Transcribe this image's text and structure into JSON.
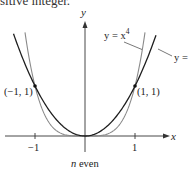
{
  "header": {
    "cropped_text": "sitive integer."
  },
  "chart_data": {
    "type": "line",
    "title": "",
    "caption": "n even",
    "xlabel": "x",
    "ylabel": "y",
    "x_ticks": [
      -1,
      1
    ],
    "x_tick_labels": [
      "−1",
      "1"
    ],
    "xlim": [
      -1.7,
      1.67
    ],
    "ylim": [
      -0.3,
      2.3
    ],
    "grid": false,
    "series": [
      {
        "name": "y = x^2",
        "label": "y =",
        "color": "#222222",
        "function": "x^2",
        "x": [
          -1.43,
          -1,
          0,
          1,
          1.42
        ],
        "values": [
          2.04,
          1,
          0,
          1,
          2.02
        ]
      },
      {
        "name": "y = x^4",
        "label": "y = x⁴",
        "color": "#888888",
        "function": "x^4",
        "x": [
          -1.2,
          -1,
          0,
          1,
          1.2
        ],
        "values": [
          2.07,
          1,
          0,
          1,
          2.07
        ]
      }
    ],
    "points": [
      {
        "label": "(−1, 1)",
        "x": -1,
        "y": 1
      },
      {
        "label": "(1, 1)",
        "x": 1,
        "y": 1
      }
    ]
  },
  "labels": {
    "x_axis": "x",
    "y_axis": "y",
    "tick_neg1": "−1",
    "tick_pos1": "1",
    "pt_left": "(−1, 1)",
    "pt_right": "(1, 1)",
    "curve_x4_prefix": "y = x",
    "curve_x4_exp": "4",
    "curve_x2_truncated": "y =",
    "caption_n": "n",
    "caption_rest": " even"
  }
}
